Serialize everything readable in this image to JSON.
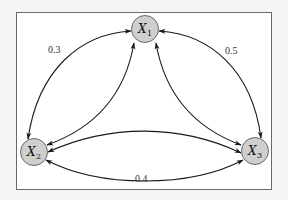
{
  "diagram": {
    "type": "graph",
    "colors": {
      "node_fill": "#cfcfcf",
      "node_stroke": "#5a5a5a",
      "edge": "#1a1a1a",
      "frame": "#6a6a6a",
      "background": "#ffffff"
    },
    "nodes": [
      {
        "id": "X1",
        "base": "X",
        "sub": "1"
      },
      {
        "id": "X2",
        "base": "X",
        "sub": "2"
      },
      {
        "id": "X3",
        "base": "X",
        "sub": "3"
      }
    ],
    "edges": [
      {
        "from": "X1",
        "to": "X2",
        "label": "0.3",
        "bidirectional": true,
        "outer": true
      },
      {
        "from": "X1",
        "to": "X3",
        "label": "0.5",
        "bidirectional": true,
        "outer": true
      },
      {
        "from": "X2",
        "to": "X3",
        "label": "0.4",
        "bidirectional": true,
        "outer": true
      },
      {
        "from": "X1",
        "to": "X2",
        "label": "",
        "bidirectional": true,
        "outer": false
      },
      {
        "from": "X1",
        "to": "X3",
        "label": "",
        "bidirectional": true,
        "outer": false
      },
      {
        "from": "X2",
        "to": "X3",
        "label": "",
        "bidirectional": true,
        "outer": false
      }
    ]
  }
}
